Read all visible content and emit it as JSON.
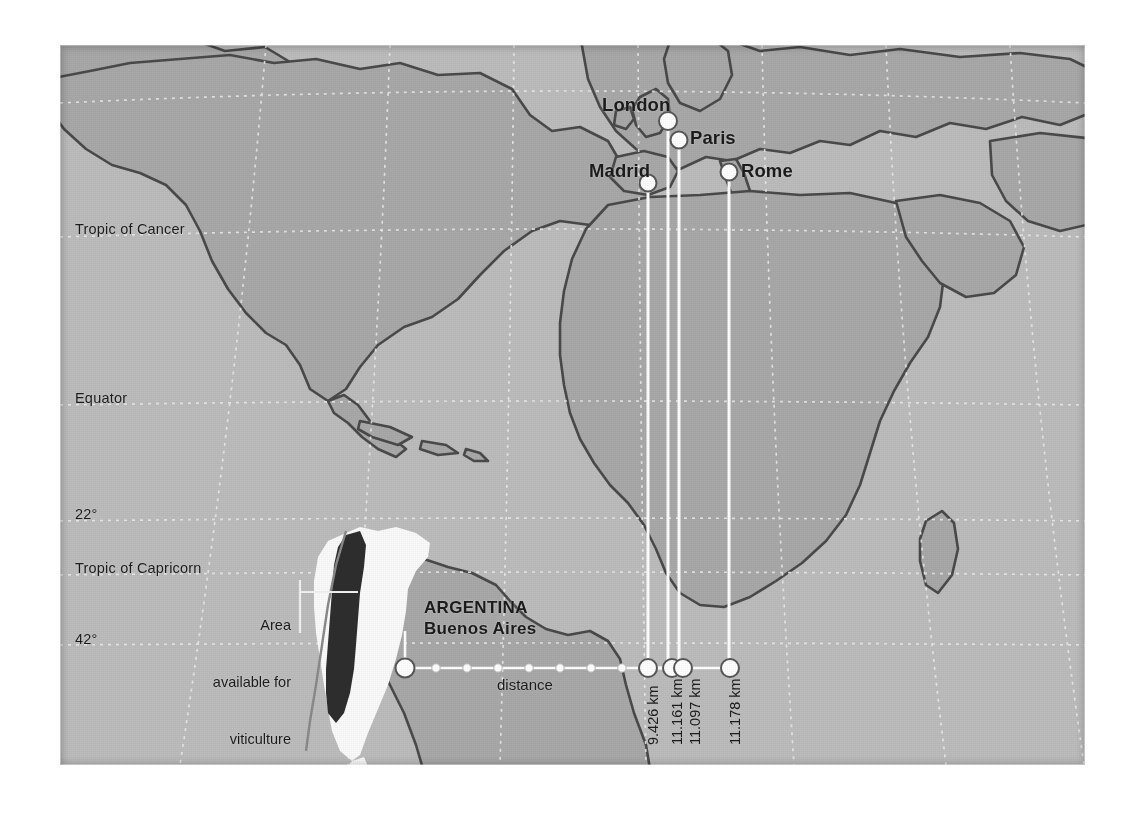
{
  "figure": {
    "kind": "thematic-world-map",
    "background_color": "#ffffff",
    "map_border_color": "#8d8d8d"
  },
  "map": {
    "ocean_color": "#bdbdbd",
    "land_color": "#a8a8a8",
    "coastline_color": "#4a4a4a",
    "graticule_color": "#ededed",
    "highlight_country_color": "#fbfbfb",
    "viticulture_area_color": "#2e2e2e",
    "marker_fill": "#ffffff",
    "marker_stroke": "#4a4a4a",
    "connector_color": "#ffffff"
  },
  "latitude_labels": [
    {
      "text": "Tropic of Cancer",
      "x": 75,
      "y": 228
    },
    {
      "text": "Equator",
      "x": 75,
      "y": 397
    },
    {
      "text": "22°",
      "x": 75,
      "y": 513
    },
    {
      "text": "Tropic of Capricorn",
      "x": 75,
      "y": 567
    },
    {
      "text": "42°",
      "x": 75,
      "y": 638
    }
  ],
  "cities": [
    {
      "name": "London",
      "label_x": 602,
      "label_y": 94,
      "dot_x": 668,
      "dot_y": 121,
      "bottom_dot_x": 648,
      "distance": "9.426 km"
    },
    {
      "name": "Paris",
      "label_x": 690,
      "label_y": 127,
      "dot_x": 679,
      "dot_y": 140,
      "bottom_dot_x": 672,
      "distance": "11.161 km"
    },
    {
      "name": "Madrid",
      "label_x": 589,
      "label_y": 160,
      "dot_x": 648,
      "dot_y": 183,
      "bottom_dot_x": 683,
      "distance": "11.097 km"
    },
    {
      "name": "Rome",
      "label_x": 741,
      "label_y": 160,
      "dot_x": 729,
      "dot_y": 172,
      "bottom_dot_x": 730,
      "distance": "11.178 km"
    }
  ],
  "distance_axis": {
    "label": "distance",
    "label_x": 497,
    "label_y": 683,
    "baseline_y": 668,
    "origin_dot_x": 405,
    "tick_dots_x": [
      436,
      467,
      498,
      529,
      560,
      591,
      622
    ],
    "km_label_y": 745,
    "km_labels": [
      {
        "text": "9.426 km",
        "x": 644
      },
      {
        "text": "11.161 km",
        "x": 668
      },
      {
        "text": "11.097 km",
        "x": 686
      },
      {
        "text": "11.178 km",
        "x": 726
      }
    ]
  },
  "argentina": {
    "country_label": "ARGENTINA",
    "capital_label": "Buenos Aires",
    "label_x": 424,
    "country_label_y": 608,
    "capital_label_y": 629,
    "capital_dot_x": 405,
    "capital_dot_y": 668,
    "capital_leader_top_y": 631
  },
  "callout": {
    "lines": [
      "Area",
      "available for",
      "viticulture"
    ],
    "text_right_x": 291,
    "text_top_y": 583,
    "bracket_x": 300,
    "bracket_top_y": 580,
    "bracket_bottom_y": 633,
    "leader_y": 592,
    "leader_end_x": 358
  }
}
